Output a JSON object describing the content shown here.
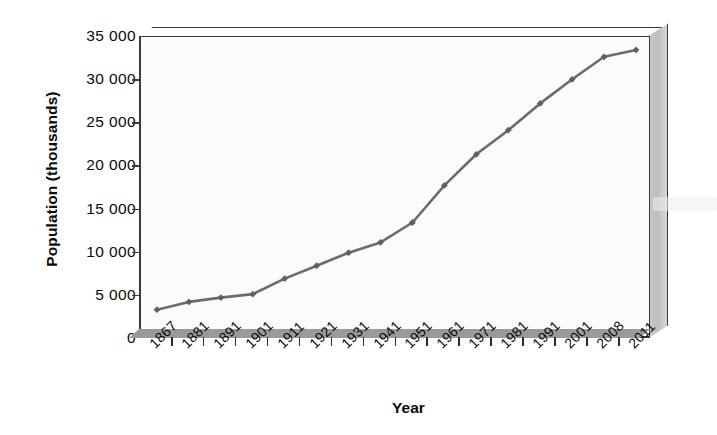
{
  "chart_data": {
    "type": "line",
    "title": "",
    "xlabel": "Year",
    "ylabel": "Population (thousands)",
    "categories": [
      "1867",
      "1881",
      "1891",
      "1901",
      "1911",
      "1921",
      "1931",
      "1941",
      "1951",
      "1961",
      "1971",
      "1981",
      "1991",
      "2001",
      "2008",
      "2011"
    ],
    "values": [
      3400,
      4300,
      4800,
      5200,
      7000,
      8500,
      10000,
      11200,
      13500,
      17800,
      21400,
      24200,
      27300,
      30100,
      32700,
      33500
    ],
    "series": [
      {
        "name": "Population",
        "values": [
          3400,
          4300,
          4800,
          5200,
          7000,
          8500,
          10000,
          11200,
          13500,
          17800,
          21400,
          24200,
          27300,
          30100,
          32700,
          33500
        ]
      }
    ],
    "ylim": [
      0,
      35000
    ],
    "ytick_values": [
      0,
      5000,
      10000,
      15000,
      20000,
      25000,
      30000,
      35000
    ],
    "ytick_labels": [
      "0",
      "5 000",
      "10 000",
      "15 000",
      "20 000",
      "25 000",
      "30 000",
      "35 000"
    ],
    "grid": false,
    "legend": "none",
    "line_color": "#6b6b6b",
    "marker_color": "#5f5f5f",
    "marker": "diamond",
    "plot_background": "#fbfbfa",
    "axis_color": "#3a3a3a",
    "side_panel_color": "#c4c4c4",
    "style": "3d-line"
  }
}
